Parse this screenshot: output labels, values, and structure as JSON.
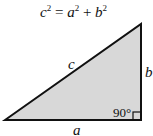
{
  "formula": {
    "c": "c",
    "exp_c": "2",
    "eq": " = ",
    "a": "a",
    "exp_a": "2",
    "plus": " + ",
    "b": "b",
    "exp_b": "2"
  },
  "labels": {
    "hypotenuse": "c",
    "vertical_side": "b",
    "horizontal_side": "a",
    "right_angle": "90°"
  },
  "colors": {
    "fill": "#d8d8d8",
    "stroke": "#111111"
  }
}
